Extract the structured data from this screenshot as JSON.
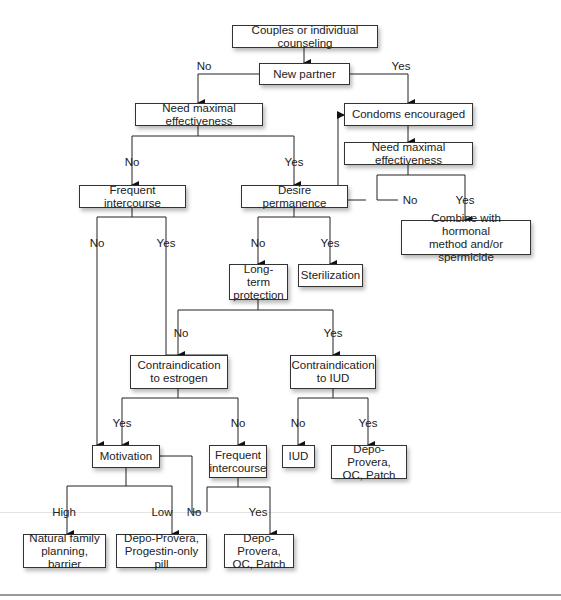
{
  "diagram": {
    "nodes": {
      "counseling": "Couples or individual counseling",
      "new_partner": "New partner",
      "need_max_left": "Need maximal effectiveness",
      "condoms": "Condoms encouraged",
      "need_max_right": "Need maximal effectiveness",
      "combine": "Combine with hormonal\nmethod and/or spermicide",
      "freq_inter_1": "Frequent intercourse",
      "desire_perm": "Desire permanence",
      "long_term": "Long-term\nprotection",
      "sterilization": "Sterilization",
      "contra_estrogen": "Contraindication\nto estrogen",
      "contra_iud": "Contraindication\nto IUD",
      "motivation": "Motivation",
      "freq_inter_2": "Frequent\nintercourse",
      "iud": "IUD",
      "depo_oc_patch_1": "Depo-Provera,\nOC, Patch",
      "nfp_barrier": "Natural family\nplanning, barrier",
      "depo_progestin": "Depo-Provera,\nProgestin-only pill",
      "depo_oc_patch_2": "Depo-Provera,\nOC, Patch"
    },
    "labels": {
      "np_no": "No",
      "np_yes": "Yes",
      "nmr_no": "No",
      "nmr_yes": "Yes",
      "nml_no": "No",
      "nml_yes": "Yes",
      "fi1_no": "No",
      "fi1_yes": "Yes",
      "dp_no": "No",
      "dp_yes": "Yes",
      "lt_no": "No",
      "lt_yes": "Yes",
      "ce_yes": "Yes",
      "ce_no": "No",
      "ci_no": "No",
      "ci_yes": "Yes",
      "mot_high": "High",
      "mot_low": "Low",
      "fi2_no": "No",
      "fi2_yes": "Yes"
    },
    "colors": {
      "line": "#222222",
      "box_border": "#333333",
      "background": "#ffffff"
    }
  }
}
